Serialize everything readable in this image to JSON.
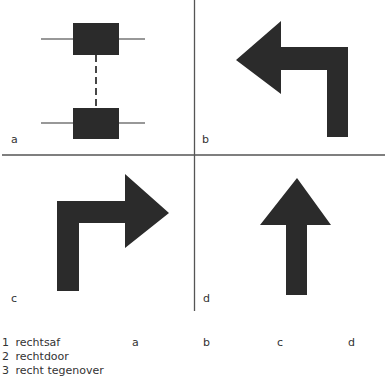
{
  "panels": [
    {
      "id": "a",
      "label": "a",
      "content": "two-boxes-dashed-link"
    },
    {
      "id": "b",
      "label": "b",
      "content": "turn-left-arrow"
    },
    {
      "id": "c",
      "label": "c",
      "content": "turn-right-arrow"
    },
    {
      "id": "d",
      "label": "d",
      "content": "straight-up-arrow"
    }
  ],
  "legend": {
    "items": [
      {
        "number": "1",
        "text": "rechtsaf"
      },
      {
        "number": "2",
        "text": "rechtdoor"
      },
      {
        "number": "3",
        "text": "recht tegenover"
      }
    ],
    "columns": [
      "a",
      "b",
      "c",
      "d"
    ]
  },
  "colors": {
    "shape_fill": "#2b2b2b",
    "divider": "#555555",
    "background": "#ffffff"
  }
}
